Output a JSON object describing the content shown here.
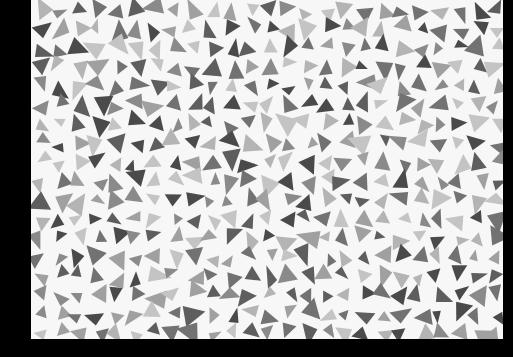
{
  "scene": {
    "description": "Photograph of a white sheet covered in scattered gray triangles and polygons, on a black background",
    "background_color": "#000000",
    "sheet_color": "#f7f7f7",
    "shape_palette": [
      "#4a4a4a",
      "#5e5e5e",
      "#727272",
      "#8a8a8a",
      "#a0a0a0",
      "#b4b4b4",
      "#c4c4c4"
    ],
    "shape_kind": "triangles"
  }
}
